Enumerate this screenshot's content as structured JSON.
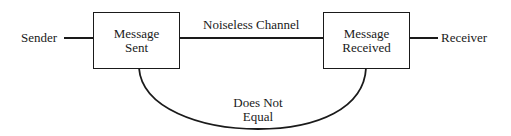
{
  "diagram": {
    "type": "flow",
    "nodes": {
      "sender": {
        "label": "Sender"
      },
      "message_sent": {
        "line1": "Message",
        "line2": "Sent"
      },
      "message_received": {
        "line1": "Message",
        "line2": "Received"
      },
      "receiver": {
        "label": "Receiver"
      }
    },
    "edges": {
      "channel": {
        "label": "Noiseless Channel"
      },
      "comparison": {
        "line1": "Does Not",
        "line2": "Equal"
      }
    },
    "colors": {
      "stroke": "#1a1a1a",
      "background": "#ffffff"
    }
  }
}
